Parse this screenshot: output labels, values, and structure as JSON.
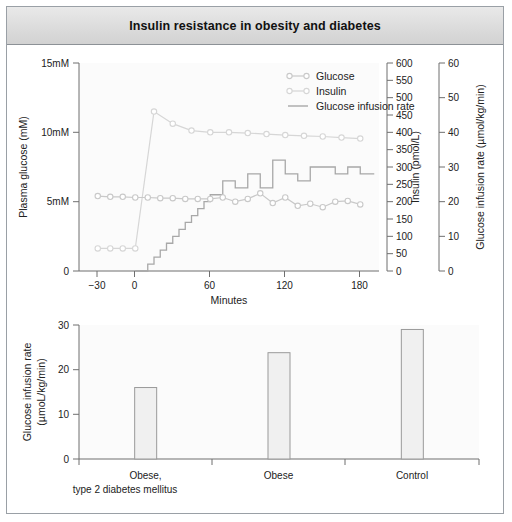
{
  "figure": {
    "title": "Insulin resistance in obesity and diabetes"
  },
  "top_panel": {
    "y_left_label": "Plasma glucose (mM)",
    "y_left_ticks": [
      "0",
      "5mM",
      "10mM",
      "15mM"
    ],
    "y_right1_label": "Insulin (pmol/L)",
    "y_right1_ticks": [
      "0",
      "50",
      "100",
      "150",
      "200",
      "250",
      "300",
      "350",
      "400",
      "450",
      "500",
      "550",
      "600"
    ],
    "y_right2_label": "Glucose infusion rate (µmol/kg/min)",
    "y_right2_ticks": [
      "0",
      "10",
      "20",
      "30",
      "40",
      "50",
      "60"
    ],
    "x_label": "Minutes",
    "x_ticks": [
      "−30",
      "0",
      "60",
      "120",
      "180"
    ],
    "legend": [
      {
        "label": "Glucose",
        "marker": "open-circle-line",
        "color": "#c9c9c9"
      },
      {
        "label": "Insulin",
        "marker": "open-circle-line",
        "color": "#c9c9c9"
      },
      {
        "label": "Glucose infusion rate",
        "marker": "plain-line",
        "color": "#a8a8a8"
      }
    ]
  },
  "bottom_panel": {
    "y_label_line1": "Glucose infusion rate",
    "y_label_line2": "(µmoL/kg/min)",
    "y_ticks": [
      "0",
      "10",
      "20",
      "30"
    ],
    "categories": [
      {
        "line1": "Obese,",
        "line2": "type 2 diabetes mellitus"
      },
      {
        "line1": "Obese",
        "line2": ""
      },
      {
        "line1": "Control",
        "line2": ""
      }
    ]
  },
  "colors": {
    "frame": "#9aa0a6",
    "titlebar": "#dcdcdc",
    "axis": "#6f6f6f",
    "glucose": "#c9c9c9",
    "insulin": "#d6d6d6",
    "infusion": "#a8a8a8",
    "bar_fill": "#f0f0f0",
    "bar_stroke": "#9a9a9a",
    "plot_bg": "#fbfbfb"
  },
  "chart_data": [
    {
      "type": "line",
      "id": "clamp-timecourse",
      "title": "Insulin resistance in obesity and diabetes",
      "xlabel": "Minutes",
      "ylabel": "Plasma glucose (mM)",
      "xlim": [
        -45,
        195
      ],
      "ylim": [
        0,
        15
      ],
      "grid": false,
      "legend_position": "top-right",
      "axes": [
        {
          "name": "left",
          "label": "Plasma glucose (mM)",
          "range": [
            0,
            15
          ],
          "ticks": [
            0,
            5,
            10,
            15
          ],
          "ticklabels": [
            "0",
            "5mM",
            "10mM",
            "15mM"
          ]
        },
        {
          "name": "right-1",
          "label": "Insulin (pmol/L)",
          "range": [
            0,
            600
          ],
          "ticks": [
            0,
            50,
            100,
            150,
            200,
            250,
            300,
            350,
            400,
            450,
            500,
            550,
            600
          ]
        },
        {
          "name": "right-2",
          "label": "Glucose infusion rate (µmol/kg/min)",
          "range": [
            0,
            60
          ],
          "ticks": [
            0,
            10,
            20,
            30,
            40,
            50,
            60
          ]
        }
      ],
      "series": [
        {
          "name": "Glucose",
          "axis": "left",
          "unit": "mM",
          "marker": "open-circle",
          "color": "#c9c9c9",
          "x": [
            -30,
            -20,
            -10,
            0,
            10,
            20,
            30,
            40,
            50,
            60,
            70,
            80,
            90,
            100,
            110,
            120,
            130,
            140,
            150,
            160,
            170,
            180
          ],
          "values": [
            5.4,
            5.35,
            5.35,
            5.3,
            5.3,
            5.25,
            5.25,
            5.2,
            5.2,
            5.2,
            5.3,
            5.0,
            5.2,
            5.6,
            4.9,
            5.3,
            4.7,
            4.85,
            4.6,
            5.0,
            5.05,
            4.8
          ]
        },
        {
          "name": "Insulin",
          "axis": "right-1",
          "unit": "pmol/L",
          "marker": "open-circle",
          "color": "#d6d6d6",
          "x": [
            -30,
            -20,
            -10,
            0,
            15,
            30,
            45,
            60,
            75,
            90,
            105,
            120,
            135,
            150,
            165,
            180
          ],
          "values": [
            65,
            65,
            65,
            65,
            460,
            425,
            405,
            400,
            400,
            398,
            395,
            392,
            390,
            388,
            385,
            382
          ]
        },
        {
          "name": "Glucose infusion rate",
          "axis": "right-2",
          "unit": "µmol/kg/min",
          "marker": "none",
          "style": "step",
          "color": "#a8a8a8",
          "x": [
            0,
            5,
            10,
            15,
            20,
            25,
            30,
            35,
            40,
            45,
            50,
            55,
            60,
            70,
            80,
            90,
            100,
            110,
            120,
            130,
            140,
            150,
            160,
            170,
            180
          ],
          "values": [
            0,
            0,
            2,
            4,
            6,
            8,
            10,
            12,
            14,
            16,
            18,
            20,
            22,
            26,
            24,
            28,
            24,
            32,
            28,
            26,
            30,
            30,
            28,
            30,
            28
          ]
        }
      ]
    },
    {
      "type": "bar",
      "id": "group-comparison",
      "xlabel": "",
      "ylabel": "Glucose infusion rate (µmoL/kg/min)",
      "ylim": [
        0,
        30
      ],
      "yticks": [
        0,
        10,
        20,
        30
      ],
      "grid": false,
      "categories": [
        "Obese, type 2 diabetes mellitus",
        "Obese",
        "Control"
      ],
      "values": [
        16,
        23.8,
        29
      ]
    }
  ]
}
